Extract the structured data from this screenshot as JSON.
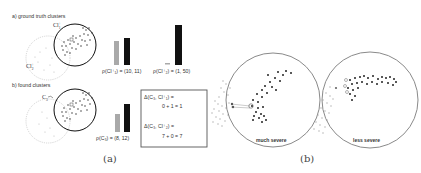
{
  "panel_a": {
    "caption": "(a)",
    "section_a": {
      "title": "a) ground truth clusters",
      "cluster_1_label": "Cl",
      "cluster_1_sup": "+",
      "cluster_1_sub": "1",
      "cluster_2_label": "Cl",
      "cluster_2_sup": "+",
      "cluster_2_sub": "2",
      "bar_pair_1_label": "ρ(Cl⁺₁) = (10, 11)",
      "bar_pair_1_values": [
        10,
        11
      ],
      "bar_pair_2_label": "ρ(Cl⁺₂) = (1, 50)",
      "bar_pair_2_values": [
        1,
        50
      ]
    },
    "section_b": {
      "title": "b) found clusters",
      "cluster_label": "C",
      "cluster_sub": "3",
      "bar_label": "ρ(C₃) = (8, 12)",
      "bar_values": [
        8,
        12
      ]
    },
    "delta_box": {
      "line1": "Δ(C₃, Cl⁺₁) =",
      "line2": "0 + 1 = 1",
      "line3": "Δ(C₃, Cl⁺₂) =",
      "line4": "7 + 0 = 7"
    }
  },
  "panel_b": {
    "caption": "(b)",
    "left_label": "much severe",
    "right_label": "less severe"
  },
  "colors": {
    "bar_gray": "#a9a9a9",
    "bar_black": "#111111",
    "circle_gray": "#8a8a8a",
    "dot_dark": "#222222",
    "dot_light": "#aaaaaa"
  }
}
